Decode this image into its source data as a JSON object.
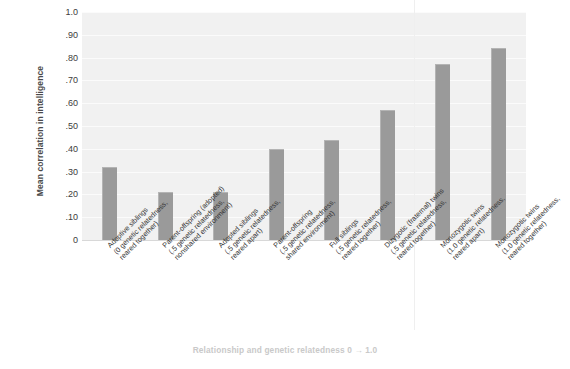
{
  "chart_data": {
    "type": "bar",
    "title": "",
    "xlabel": "Relationship and genetic relatedness 0 → 1.0",
    "ylabel": "Mean correlation in intelligence",
    "ylim": [
      0,
      1.0
    ],
    "grid": true,
    "legend": "none",
    "bar_color": "#9a9a9a",
    "plot_background": "#f1f1f1",
    "gridline_color": "#fbfbfb",
    "ytick_labels": [
      "1.0",
      ".90",
      ".80",
      ".70",
      ".60",
      ".50",
      ".40",
      ".30",
      ".20",
      ".10",
      "0"
    ],
    "ytick_values": [
      1.0,
      0.9,
      0.8,
      0.7,
      0.6,
      0.5,
      0.4,
      0.3,
      0.2,
      0.1,
      0
    ],
    "categories": [
      "Adoptive siblings (0 genetic relatedness, reared together)",
      "Parent-offspring (adopted) (.5 genetic relatedness, nonshared environment)",
      "Adopted siblings (.5 genetic relatedness, reared apart)",
      "Parent-offspring (.5 genetic relatedness, shared environment)",
      "Full siblings (.5 genetic relatedness, reared together)",
      "Dizygotic (fraternal) twins (.5 genetic relatedness, reared together)",
      "Monozygotic twins (1.0 genetic relatedness, reared apart)",
      "Monozygotic twins (1.0 genetic relatedness, reared together)"
    ],
    "category_lines": [
      [
        "Adoptive siblings",
        "(0 genetic relatedness,",
        "reared together)"
      ],
      [
        "Parent-offspring (adopted)",
        "(.5 genetic relatedness,",
        "nonshared environment)"
      ],
      [
        "Adopted siblings",
        "(.5 genetic relatedness,",
        "reared apart)"
      ],
      [
        "Parent-offspring",
        "(.5 genetic relatedness,",
        "shared environment)"
      ],
      [
        "Full siblings",
        "(.5 genetic relatedness,",
        "reared together)"
      ],
      [
        "Dizygotic (fraternal) twins",
        "(.5 genetic relatedness,",
        "reared together)"
      ],
      [
        "Monozygotic twins",
        "(1.0 genetic relatedness,",
        "reared apart)"
      ],
      [
        "Monozygotic twins",
        "(1.0 genetic relatedness,",
        "reared together)"
      ]
    ],
    "values": [
      0.32,
      0.21,
      0.21,
      0.4,
      0.44,
      0.57,
      0.77,
      0.84
    ]
  }
}
